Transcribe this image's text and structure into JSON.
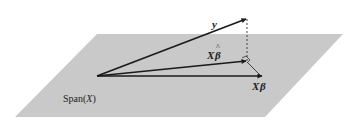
{
  "diagram": {
    "type": "geometric projection",
    "plane": {
      "label": "Span(",
      "label_var": "X",
      "label_close": ")",
      "fill": "#c9c9c9"
    },
    "vectors": {
      "y": {
        "label": "y"
      },
      "x_beta_hat": {
        "label_x": "X",
        "label_beta": "β",
        "label_hat": "^"
      },
      "x_beta": {
        "label_x": "X",
        "label_beta": "β"
      }
    },
    "colors": {
      "arrow": "#1a1a1a",
      "dashed": "#333333"
    }
  }
}
